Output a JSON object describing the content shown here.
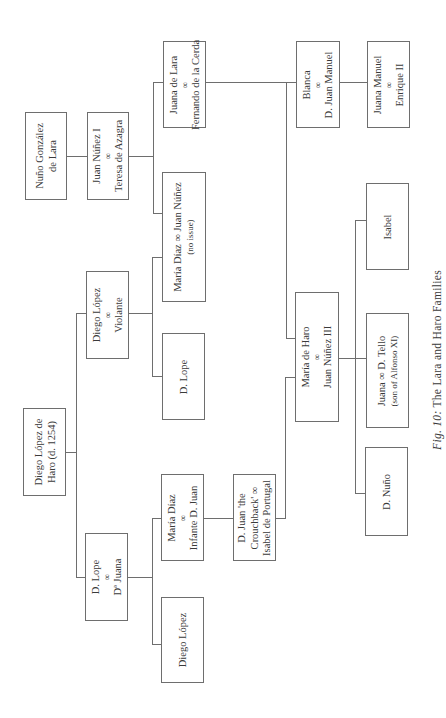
{
  "diagram": {
    "type": "family-tree",
    "orientation": "rotated-90-ccw",
    "line_color": "#6e6e6e",
    "text_color": "#3a3a3a",
    "marriage_symbol": "∞"
  },
  "caption": {
    "fig_label": "Fig. 10:",
    "title": "The Lara and Haro Families"
  },
  "nodes": {
    "nuno_gonzalez": {
      "line1": "Nuño González",
      "line2": "de Lara"
    },
    "juan_nunez_i": {
      "line1": "Juan Núñez I",
      "sym": "∞",
      "line2": "Teresa de Azagra"
    },
    "juana_de_lara": {
      "line1": "Juana de Lara",
      "sym": "∞",
      "line2": "Fernando de la Cerda"
    },
    "maria_diaz_juan_nunez": {
      "line1": "María Díaz ∞ Juan Núñez",
      "line2": "(no issue)"
    },
    "diego_lopez_de_haro": {
      "line1": "Diego López de",
      "line2": "Haro (d. 1254)"
    },
    "diego_lopez_violante": {
      "line1": "Diego López",
      "sym": "∞",
      "line2": "Violante"
    },
    "d_lope_1": {
      "line1": "D. Lope"
    },
    "d_lope_juana": {
      "line1": "D. Lope",
      "sym": "∞",
      "line2": "Dª Juana"
    },
    "maria_diaz_infante": {
      "line1": "María Díaz",
      "sym": "∞",
      "line2": "Infante D. Juan"
    },
    "diego_lopez_2": {
      "line1": "Diego López"
    },
    "d_juan_crouchback": {
      "line1": "D. Juan 'the",
      "line2": "Crouchback' ∞",
      "line3": "Isabel de Portugal"
    },
    "maria_de_haro": {
      "line1": "María de Haro",
      "sym": "∞",
      "line2": "Juan Núñez III"
    },
    "blanca": {
      "line1": "Blanca",
      "sym": "∞",
      "line2": "D. Juan Manuel"
    },
    "juana_manuel": {
      "line1": "Juana Manuel",
      "sym": "∞",
      "line2": "Enrique II"
    },
    "isabel": {
      "line1": "Isabel"
    },
    "juana_tello": {
      "line1": "Juana ∞ D. Tello",
      "line2": "(son of Alfonso XI)"
    },
    "d_nuno": {
      "line1": "D. Nuño"
    }
  },
  "edges": [
    [
      "nuno_gonzalez",
      "juan_nunez_i"
    ],
    [
      "juan_nunez_i",
      "juana_de_lara"
    ],
    [
      "juan_nunez_i",
      "maria_diaz_juan_nunez"
    ],
    [
      "juana_de_lara",
      "blanca"
    ],
    [
      "juana_de_lara",
      "maria_de_haro"
    ],
    [
      "blanca",
      "juana_manuel"
    ],
    [
      "diego_lopez_de_haro",
      "diego_lopez_violante"
    ],
    [
      "diego_lopez_de_haro",
      "d_lope_juana"
    ],
    [
      "diego_lopez_violante",
      "maria_diaz_juan_nunez"
    ],
    [
      "diego_lopez_violante",
      "d_lope_1"
    ],
    [
      "d_lope_juana",
      "maria_diaz_infante"
    ],
    [
      "d_lope_juana",
      "diego_lopez_2"
    ],
    [
      "maria_diaz_infante",
      "d_juan_crouchback"
    ],
    [
      "d_juan_crouchback",
      "maria_de_haro"
    ],
    [
      "maria_de_haro",
      "isabel"
    ],
    [
      "maria_de_haro",
      "juana_tello"
    ],
    [
      "maria_de_haro",
      "d_nuno"
    ]
  ]
}
